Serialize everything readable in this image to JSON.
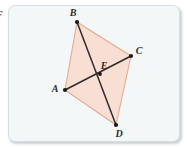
{
  "figure": {
    "kind": "geometry-quadrilateral-with-diagonals",
    "edge_glyph": "F",
    "background_color": "#f4f7f8",
    "card_border_color": "#d3dde2",
    "fill_color": "#f8ded3",
    "side_stroke_color": "#e2ab93",
    "diagonal_stroke_color": "#2e2a28",
    "vertex_dot_color": "#1c1a19",
    "label_color": "#2b2b2b",
    "vertices": [
      {
        "name": "B",
        "x": 68,
        "y": 16,
        "label_x": 64,
        "label_y": 10,
        "label": "B"
      },
      {
        "name": "C",
        "x": 122,
        "y": 50,
        "label_x": 130,
        "label_y": 48,
        "label": "C"
      },
      {
        "name": "D",
        "x": 107,
        "y": 119,
        "label_x": 110,
        "label_y": 131,
        "label": "D"
      },
      {
        "name": "A",
        "x": 56,
        "y": 84,
        "label_x": 46,
        "label_y": 86,
        "label": "A"
      },
      {
        "name": "E",
        "x": 91,
        "y": 68,
        "label_x": 92,
        "label_y": 63,
        "label": "E"
      }
    ],
    "sides": [
      {
        "name": "side-AB",
        "from": "A",
        "to": "B"
      },
      {
        "name": "side-BC",
        "from": "B",
        "to": "C"
      },
      {
        "name": "side-CD",
        "from": "C",
        "to": "D"
      },
      {
        "name": "side-DA",
        "from": "D",
        "to": "A"
      }
    ],
    "diagonals": [
      {
        "name": "diagonal-AC",
        "from": "A",
        "to": "C"
      },
      {
        "name": "diagonal-BD",
        "from": "B",
        "to": "D"
      }
    ],
    "polygon_points": "68,16 122,50 107,119 56,84"
  }
}
